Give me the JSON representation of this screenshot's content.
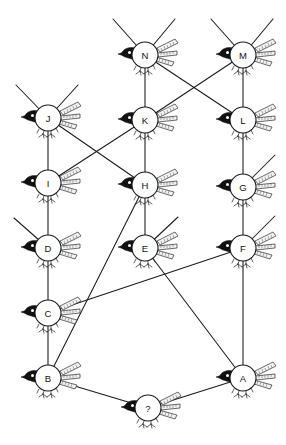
{
  "diagram": {
    "kind": "node-link-graph",
    "canvas": {
      "width": 286,
      "height": 445,
      "background": "#ffffff"
    },
    "style": {
      "edge_color": "#1a1a1a",
      "node_fill": "#ffffff",
      "node_stroke": "#1a1a1a",
      "label_color": "#111111",
      "bird_dark": "#111111",
      "node_radius": 13
    },
    "icon": "bird-icon",
    "nodes": [
      {
        "id": "N",
        "label": "N",
        "x": 145,
        "y": 55
      },
      {
        "id": "M",
        "label": "M",
        "x": 243,
        "y": 55
      },
      {
        "id": "J",
        "label": "J",
        "x": 48,
        "y": 118
      },
      {
        "id": "K",
        "label": "K",
        "x": 145,
        "y": 120
      },
      {
        "id": "L",
        "label": "L",
        "x": 243,
        "y": 120
      },
      {
        "id": "I",
        "label": "I",
        "x": 48,
        "y": 183
      },
      {
        "id": "H",
        "label": "H",
        "x": 145,
        "y": 185
      },
      {
        "id": "G",
        "label": "G",
        "x": 243,
        "y": 187
      },
      {
        "id": "D",
        "label": "D",
        "x": 48,
        "y": 248
      },
      {
        "id": "E",
        "label": "E",
        "x": 145,
        "y": 248
      },
      {
        "id": "F",
        "label": "F",
        "x": 243,
        "y": 248
      },
      {
        "id": "C",
        "label": "C",
        "x": 48,
        "y": 313
      },
      {
        "id": "B",
        "label": "B",
        "x": 48,
        "y": 378
      },
      {
        "id": "A",
        "label": "A",
        "x": 243,
        "y": 378
      },
      {
        "id": "Q",
        "label": "?",
        "x": 148,
        "y": 408
      }
    ],
    "edges": [
      {
        "from": "N",
        "to": "K"
      },
      {
        "from": "M",
        "to": "L"
      },
      {
        "from": "N",
        "to": "L"
      },
      {
        "from": "M",
        "to": "K"
      },
      {
        "from": "J",
        "to": "I"
      },
      {
        "from": "K",
        "to": "H"
      },
      {
        "from": "L",
        "to": "G"
      },
      {
        "from": "J",
        "to": "H"
      },
      {
        "from": "K",
        "to": "I"
      },
      {
        "from": "I",
        "to": "D"
      },
      {
        "from": "H",
        "to": "E"
      },
      {
        "from": "G",
        "to": "F"
      },
      {
        "from": "D",
        "to": "C"
      },
      {
        "from": "C",
        "to": "B"
      },
      {
        "from": "F",
        "to": "A"
      },
      {
        "from": "H",
        "to": "B"
      },
      {
        "from": "C",
        "to": "F"
      },
      {
        "from": "E",
        "to": "A"
      },
      {
        "from": "B",
        "to": "Q"
      },
      {
        "from": "Q",
        "to": "A"
      }
    ],
    "stubs": [
      {
        "node": "N",
        "dx": -32,
        "dy": -36
      },
      {
        "node": "N",
        "dx": 30,
        "dy": -36
      },
      {
        "node": "M",
        "dx": -32,
        "dy": -36
      },
      {
        "node": "M",
        "dx": 30,
        "dy": -36
      },
      {
        "node": "J",
        "dx": -32,
        "dy": -33
      },
      {
        "node": "J",
        "dx": 30,
        "dy": -33
      },
      {
        "node": "D",
        "dx": -34,
        "dy": -30
      },
      {
        "node": "E",
        "dx": 33,
        "dy": -31
      },
      {
        "node": "G",
        "dx": 32,
        "dy": -32
      },
      {
        "node": "F",
        "dx": 32,
        "dy": -32
      }
    ]
  }
}
